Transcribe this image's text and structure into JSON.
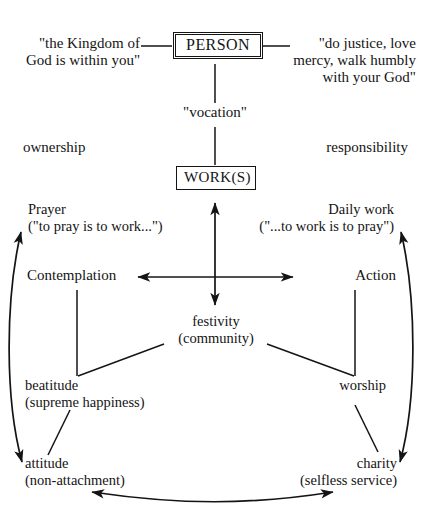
{
  "diagram": {
    "type": "concept-diagram",
    "background_color": "#ffffff",
    "line_color": "#141414",
    "nodes": {
      "person": {
        "label": "PERSON",
        "box": "double"
      },
      "works": {
        "label": "WORK(S)",
        "box": "single"
      },
      "vocation": {
        "label": "\"vocation\""
      },
      "kingdom_quote": {
        "line1": "\"the Kingdom of",
        "line2": "God is within you\""
      },
      "justice_quote": {
        "line1": "\"do justice, love",
        "line2": "mercy, walk humbly",
        "line3": "with your God\""
      },
      "ownership": {
        "label": "ownership"
      },
      "responsibility": {
        "label": "responsibility"
      },
      "prayer": {
        "line1": "Prayer",
        "line2": "(\"to pray is to work...\")"
      },
      "daily_work": {
        "line1": "Daily work",
        "line2": "(\"...to work is to pray\")"
      },
      "contemplation": {
        "label": "Contemplation"
      },
      "action": {
        "label": "Action"
      },
      "festivity": {
        "line1": "festivity",
        "line2": "(community)"
      },
      "beatitude": {
        "line1": "beatitude",
        "line2": "(supreme happiness)"
      },
      "worship": {
        "label": "worship"
      },
      "attitude": {
        "line1": "attitude",
        "line2": "(non-attachment)"
      },
      "charity": {
        "line1": "charity",
        "line2": "(selfless service)"
      }
    },
    "edges": [
      {
        "name": "kingdom-to-person",
        "style": "plain-line",
        "from": "kingdom_quote",
        "to": "person"
      },
      {
        "name": "person-to-justice",
        "style": "plain-line",
        "from": "person",
        "to": "justice_quote"
      },
      {
        "name": "person-to-vocation",
        "style": "plain-line",
        "from": "person",
        "to": "vocation"
      },
      {
        "name": "vocation-to-works",
        "style": "plain-line",
        "from": "vocation",
        "to": "works"
      },
      {
        "name": "works-festivity-axis",
        "style": "double-arrow-vertical",
        "from": "works",
        "to": "festivity"
      },
      {
        "name": "contemplation-action-axis",
        "style": "double-arrow-horizontal",
        "from": "contemplation",
        "to": "action"
      },
      {
        "name": "contemplation-to-beatitude",
        "style": "plain-line",
        "from": "contemplation",
        "to": "beatitude"
      },
      {
        "name": "festivity-to-beatitude",
        "style": "plain-line",
        "from": "festivity",
        "to": "beatitude"
      },
      {
        "name": "action-to-worship",
        "style": "plain-line",
        "from": "action",
        "to": "worship"
      },
      {
        "name": "festivity-to-worship",
        "style": "plain-line",
        "from": "festivity",
        "to": "worship"
      },
      {
        "name": "beatitude-to-attitude",
        "style": "plain-line",
        "from": "beatitude",
        "to": "attitude"
      },
      {
        "name": "worship-to-charity",
        "style": "plain-line",
        "from": "worship",
        "to": "charity"
      },
      {
        "name": "prayer-attitude-arc",
        "style": "double-arrow-curve",
        "from": "prayer",
        "to": "attitude"
      },
      {
        "name": "dailywork-charity-arc",
        "style": "double-arrow-curve",
        "from": "daily_work",
        "to": "charity"
      },
      {
        "name": "attitude-charity-arc",
        "style": "double-arrow-curve",
        "from": "attitude",
        "to": "charity"
      }
    ]
  }
}
